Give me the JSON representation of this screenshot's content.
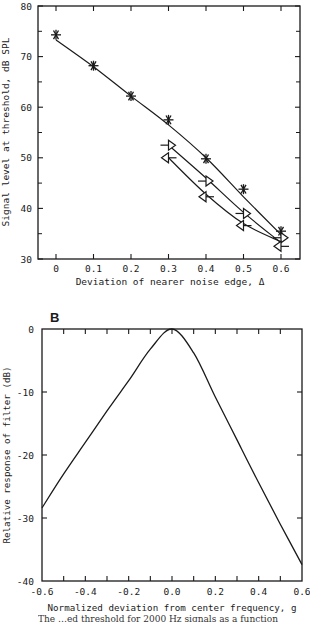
{
  "chart_data": [
    {
      "panel_label": "",
      "type": "line",
      "title": "",
      "xlabel": "Deviation of nearer noise edge, Δ",
      "ylabel": "Signal level at threshold, dB SPL",
      "xlim": [
        -0.05,
        0.65
      ],
      "ylim": [
        30,
        80
      ],
      "xticks": [
        0,
        0.1,
        0.2,
        0.3,
        0.4,
        0.5,
        0.6
      ],
      "xtick_labels": [
        "0",
        "0.1",
        "0.2",
        "0.3",
        "0.4",
        "0.5",
        "0.6"
      ],
      "yticks": [
        30,
        40,
        50,
        60,
        70,
        80
      ],
      "ytick_labels": [
        "30",
        "40",
        "50",
        "60",
        "70",
        "80"
      ],
      "yminor_ticks": [
        35,
        45,
        55,
        65,
        75
      ],
      "grid": false,
      "legend": null,
      "series": [
        {
          "name": "symmetric (asterisk)",
          "marker": "asterisk",
          "x": [
            0,
            0.1,
            0.2,
            0.3,
            0.4,
            0.5,
            0.6
          ],
          "y": [
            74.3,
            68.2,
            62.2,
            57.5,
            49.8,
            43.8,
            35.5
          ],
          "fit_x": [
            0,
            0.1,
            0.2,
            0.3,
            0.4,
            0.5,
            0.6
          ],
          "fit_y": [
            73.3,
            68.0,
            62.2,
            56.5,
            50.0,
            42.3,
            34.8
          ]
        },
        {
          "name": "asymmetric (right triangle)",
          "marker": "triangle-right",
          "x": [
            0.3,
            0.4,
            0.5,
            0.6
          ],
          "y": [
            52.5,
            45.4,
            39.0,
            34.2
          ],
          "fit_x": [
            0.3,
            0.4,
            0.5,
            0.6
          ],
          "fit_y": [
            52.5,
            46.0,
            39.2,
            33.2
          ]
        },
        {
          "name": "asymmetric (left triangle)",
          "marker": "triangle-left",
          "x": [
            0.3,
            0.4,
            0.5,
            0.6
          ],
          "y": [
            50.0,
            42.3,
            36.6,
            32.5
          ],
          "fit_x": [
            0.3,
            0.4,
            0.5,
            0.6
          ],
          "fit_y": [
            50.0,
            42.8,
            37.0,
            33.4
          ]
        }
      ]
    },
    {
      "panel_label": "B",
      "type": "line",
      "title": "",
      "xlabel": "Normalized deviation from center frequency, g",
      "ylabel": "Relative response of filter (dB)",
      "xlim": [
        -0.6,
        0.6
      ],
      "ylim": [
        -40,
        0
      ],
      "xticks": [
        -0.6,
        -0.4,
        -0.2,
        0.0,
        0.2,
        0.4,
        0.6
      ],
      "xtick_labels": [
        "-0.6",
        "-0.4",
        "-0.2",
        "0.0",
        "0.2",
        "0.4",
        "0.6"
      ],
      "xminor_ticks": [
        -0.5,
        -0.3,
        -0.1,
        0.1,
        0.3,
        0.5
      ],
      "yticks": [
        -40,
        -30,
        -20,
        -10,
        0
      ],
      "ytick_labels": [
        "-40",
        "-30",
        "-20",
        "-10",
        "0"
      ],
      "grid": false,
      "legend": null,
      "series": [
        {
          "name": "filter shape",
          "marker": "none",
          "x": [
            -0.6,
            -0.5,
            -0.4,
            -0.3,
            -0.2,
            -0.1,
            0.0,
            0.1,
            0.2,
            0.3,
            0.4,
            0.5,
            0.6
          ],
          "y": [
            -28.4,
            -23.0,
            -18.0,
            -13.0,
            -8.2,
            -3.2,
            0.0,
            -3.8,
            -10.8,
            -17.6,
            -24.4,
            -31.0,
            -37.4
          ]
        }
      ]
    }
  ],
  "caption_partial": "The …ed threshold for 2000 Hz signals as a function"
}
